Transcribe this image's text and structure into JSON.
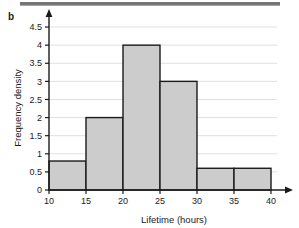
{
  "panel": {
    "label": "b"
  },
  "chart_data": {
    "type": "bar",
    "title": "",
    "subtitle": "",
    "xlabel": "Lifetime (hours)",
    "ylabel": "Frequency density",
    "xlim": [
      10,
      40
    ],
    "ylim": [
      0,
      4.75
    ],
    "grid": true,
    "legend": false,
    "legend_position": "none",
    "xticks": [
      "10",
      "15",
      "20",
      "25",
      "30",
      "35",
      "40"
    ],
    "xtick_values": [
      10,
      15,
      20,
      25,
      30,
      35,
      40
    ],
    "yticks": [
      "0",
      "0.5",
      "1",
      "1.5",
      "2",
      "2.5",
      "3",
      "3.5",
      "4",
      "4.5"
    ],
    "ytick_values": [
      0,
      0.5,
      1,
      1.5,
      2,
      2.5,
      3,
      3.5,
      4,
      4.5
    ],
    "bins": [
      {
        "start": 10,
        "end": 15,
        "value": 0.8
      },
      {
        "start": 15,
        "end": 20,
        "value": 2
      },
      {
        "start": 20,
        "end": 25,
        "value": 4
      },
      {
        "start": 25,
        "end": 30,
        "value": 3
      },
      {
        "start": 30,
        "end": 35,
        "value": 0.6
      },
      {
        "start": 35,
        "end": 40,
        "value": 0.6
      }
    ],
    "categories": [
      "10-15",
      "15-20",
      "20-25",
      "25-30",
      "30-35",
      "35-40"
    ],
    "values": [
      0.8,
      2,
      4,
      3,
      0.6,
      0.6
    ],
    "annotations": []
  },
  "colors": {
    "bar_fill": "#cccccc",
    "bar_stroke": "#1a1a1a",
    "axis": "#1a1a1a",
    "grid": "#d8d8d8",
    "text": "#1a1a1a",
    "scan_strip": "#6e6e6e"
  }
}
